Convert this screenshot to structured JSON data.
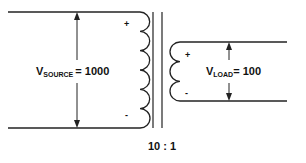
{
  "diagram": {
    "type": "transformer-step-down",
    "primary": {
      "label_main": "V",
      "label_sub": "SOURCE",
      "label_value": "= 1000",
      "polarity_top": "+",
      "polarity_bottom": "-",
      "turns": 6
    },
    "secondary": {
      "label_main": "V",
      "label_sub": "LOAD",
      "label_value": "= 100",
      "polarity_top": "+",
      "polarity_bottom": "-",
      "turns": 3
    },
    "ratio": "10 : 1",
    "line_color": "#222222"
  }
}
